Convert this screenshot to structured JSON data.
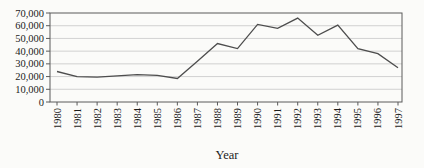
{
  "chart_data": {
    "type": "line",
    "title": "",
    "xlabel": "Year",
    "ylabel": "",
    "x": [
      "1980",
      "1981",
      "1982",
      "1983",
      "1984",
      "1985",
      "1986",
      "1987",
      "1988",
      "1989",
      "1990",
      "1991",
      "1992",
      "1993",
      "1994",
      "1995",
      "1996",
      "1997"
    ],
    "series": [
      {
        "name": "value",
        "values": [
          24000,
          20000,
          19500,
          20500,
          21500,
          21000,
          18500,
          32000,
          46000,
          42000,
          61000,
          58000,
          66000,
          52500,
          60500,
          42000,
          38000,
          27000
        ]
      }
    ],
    "ylim": [
      0,
      70000
    ],
    "ytick_step": 10000,
    "ytick_labels": [
      "0",
      "10,000",
      "20,000",
      "30,000",
      "40,000",
      "50,000",
      "60,000",
      "70,000"
    ],
    "grid": true,
    "legend": false,
    "colors": {
      "line": "#4d4d4d",
      "grid": "#c6c6c6",
      "axis": "#5a5a5a",
      "text": "#1c1c1c",
      "background": "#fbfbf9"
    }
  }
}
